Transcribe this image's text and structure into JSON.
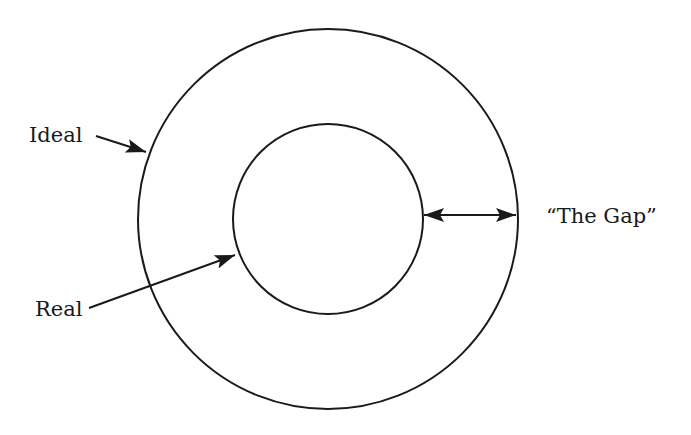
{
  "diagram": {
    "type": "concentric-circles",
    "outer_circle": {
      "label": "Ideal",
      "cx": 328,
      "cy": 219,
      "r": 190
    },
    "inner_circle": {
      "label": "Real",
      "cx": 328,
      "cy": 219,
      "r": 95
    },
    "gap": {
      "label": "“The Gap”"
    },
    "stroke_color": "#1a1a1a",
    "background": "#ffffff"
  },
  "labels": {
    "ideal": "Ideal",
    "real": "Real",
    "gap": "“The Gap”"
  }
}
